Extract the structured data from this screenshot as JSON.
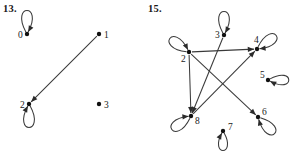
{
  "figures": [
    {
      "id": "fig13",
      "number": "13.",
      "number_pos": {
        "x": 3,
        "y": 3
      },
      "type": "directed-graph",
      "nodes": [
        {
          "id": "0",
          "label": "0",
          "x": 27,
          "y": 34,
          "label_dx": -9,
          "label_dy": 4
        },
        {
          "id": "1",
          "label": "1",
          "x": 99,
          "y": 34,
          "label_dx": 5,
          "label_dy": 4
        },
        {
          "id": "2",
          "label": "2",
          "x": 29,
          "y": 104,
          "label_dx": -9,
          "label_dy": 4
        },
        {
          "id": "3",
          "label": "3",
          "x": 99,
          "y": 104,
          "label_dx": 5,
          "label_dy": 4
        }
      ],
      "edges": [
        {
          "from": "1",
          "to": "2",
          "kind": "straight"
        }
      ],
      "self_loops": [
        {
          "node": "0",
          "direction": "up",
          "size": 17
        },
        {
          "node": "2",
          "direction": "down",
          "size": 17
        }
      ]
    },
    {
      "id": "fig15",
      "number": "15.",
      "number_pos": {
        "x": 148,
        "y": 3
      },
      "type": "directed-graph",
      "nodes": [
        {
          "id": "2",
          "label": "2",
          "x": 189,
          "y": 52,
          "label_dx": -8,
          "label_dy": 10
        },
        {
          "id": "3",
          "label": "3",
          "x": 224,
          "y": 35,
          "label_dx": -9,
          "label_dy": 3
        },
        {
          "id": "4",
          "label": "4",
          "x": 257,
          "y": 49,
          "label_dx": -3,
          "label_dy": -6
        },
        {
          "id": "5",
          "label": "5",
          "x": 268,
          "y": 80,
          "label_dx": -8,
          "label_dy": -2
        },
        {
          "id": "6",
          "label": "6",
          "x": 258,
          "y": 117,
          "label_dx": 4,
          "label_dy": -2
        },
        {
          "id": "7",
          "label": "7",
          "x": 223,
          "y": 131,
          "label_dx": 5,
          "label_dy": -1
        },
        {
          "id": "8",
          "label": "8",
          "x": 191,
          "y": 116,
          "label_dx": 4,
          "label_dy": 8
        }
      ],
      "edges": [
        {
          "from": "2",
          "to": "4",
          "kind": "straight"
        },
        {
          "from": "2",
          "to": "8",
          "kind": "straight"
        },
        {
          "from": "2",
          "to": "6",
          "kind": "straight"
        },
        {
          "from": "3",
          "to": "8",
          "kind": "straight"
        },
        {
          "from": "8",
          "to": "4",
          "kind": "straight"
        }
      ],
      "self_loops": [
        {
          "node": "2",
          "direction": "up-left",
          "size": 17
        },
        {
          "node": "3",
          "direction": "up",
          "size": 17
        },
        {
          "node": "4",
          "direction": "up-right",
          "size": 17
        },
        {
          "node": "5",
          "direction": "right",
          "size": 15
        },
        {
          "node": "6",
          "direction": "down-right",
          "size": 17
        },
        {
          "node": "7",
          "direction": "down",
          "size": 14
        },
        {
          "node": "8",
          "direction": "down-left",
          "size": 17
        }
      ]
    }
  ],
  "style": {
    "stroke_color": "#3a3a3a",
    "node_color": "#111111",
    "label_color": "#1a1a1a",
    "background": "#ffffff"
  }
}
